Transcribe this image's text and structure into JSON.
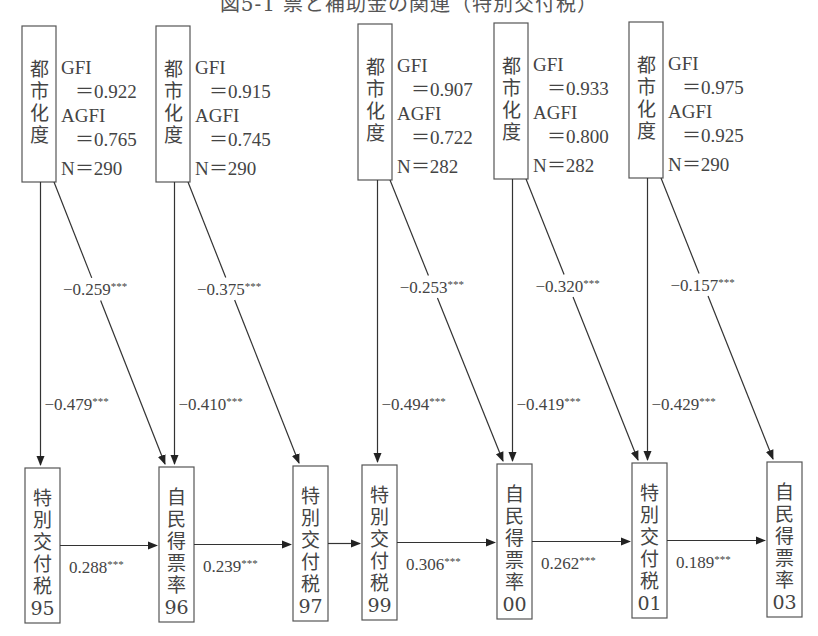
{
  "title": "図5-1 票と補助金の関連（特別交付税）",
  "diagram": {
    "models": [
      {
        "source": {
          "label": [
            "都",
            "市",
            "化",
            "度"
          ]
        },
        "fit": {
          "gfi_label": "GFI",
          "gfi": "＝0.922",
          "agfi_label": "AGFI",
          "agfi": "＝0.765",
          "n": "N＝290"
        },
        "diag_coef": "−0.259",
        "vert_coef": "−0.479",
        "stars": "***"
      },
      {
        "source": {
          "label": [
            "都",
            "市",
            "化",
            "度"
          ]
        },
        "fit": {
          "gfi_label": "GFI",
          "gfi": "＝0.915",
          "agfi_label": "AGFI",
          "agfi": "＝0.745",
          "n": "N＝290"
        },
        "diag_coef": "−0.375",
        "vert_coef": "−0.410",
        "stars": "***"
      },
      {
        "source": {
          "label": [
            "都",
            "市",
            "化",
            "度"
          ]
        },
        "fit": {
          "gfi_label": "GFI",
          "gfi": "＝0.907",
          "agfi_label": "AGFI",
          "agfi": "＝0.722",
          "n": "N＝282"
        },
        "diag_coef": "−0.253",
        "vert_coef": "−0.494",
        "stars": "***"
      },
      {
        "source": {
          "label": [
            "都",
            "市",
            "化",
            "度"
          ]
        },
        "fit": {
          "gfi_label": "GFI",
          "gfi": "＝0.933",
          "agfi_label": "AGFI",
          "agfi": "＝0.800",
          "n": "N＝282"
        },
        "diag_coef": "−0.320",
        "vert_coef": "−0.419",
        "stars": "***"
      },
      {
        "source": {
          "label": [
            "都",
            "市",
            "化",
            "度"
          ]
        },
        "fit": {
          "gfi_label": "GFI",
          "gfi": "＝0.975",
          "agfi_label": "AGFI",
          "agfi": "＝0.925",
          "n": "N＝290"
        },
        "diag_coef": "−0.157",
        "vert_coef": "−0.429",
        "stars": "***"
      }
    ],
    "outcomes": [
      {
        "label": [
          "特",
          "別",
          "交",
          "付",
          "税"
        ],
        "year": "95"
      },
      {
        "label": [
          "自",
          "民",
          "得",
          "票",
          "率"
        ],
        "year": "96"
      },
      {
        "label": [
          "特",
          "別",
          "交",
          "付",
          "税"
        ],
        "year": "97"
      },
      {
        "label": [
          "特",
          "別",
          "交",
          "付",
          "税"
        ],
        "year": "99"
      },
      {
        "label": [
          "自",
          "民",
          "得",
          "票",
          "率"
        ],
        "year": "00"
      },
      {
        "label": [
          "特",
          "別",
          "交",
          "付",
          "税"
        ],
        "year": "01"
      },
      {
        "label": [
          "自",
          "民",
          "得",
          "票",
          "率"
        ],
        "year": "03"
      }
    ],
    "horizontal_paths": [
      {
        "coef": "0.288",
        "stars": "***"
      },
      {
        "coef": "0.239",
        "stars": "***"
      },
      {
        "coef": "",
        "stars": ""
      },
      {
        "coef": "0.306",
        "stars": "***"
      },
      {
        "coef": "0.262",
        "stars": "***"
      },
      {
        "coef": "0.189",
        "stars": "***"
      }
    ]
  }
}
